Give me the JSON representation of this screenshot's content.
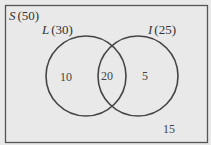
{
  "diagram": {
    "type": "venn",
    "universe": {
      "symbol": "S",
      "count": "(50)"
    },
    "sets": [
      {
        "symbol": "L",
        "count": "(30)"
      },
      {
        "symbol": "I",
        "count": "(25)"
      }
    ],
    "regions": {
      "only_L": "10",
      "both": "20",
      "only_I": "5",
      "neither": "15"
    },
    "colors": {
      "background": "#e9e9e9",
      "stroke": "#444444"
    }
  }
}
